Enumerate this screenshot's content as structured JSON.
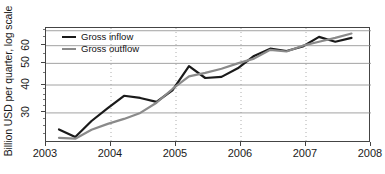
{
  "chart_data": {
    "type": "line",
    "title": "",
    "xlabel": "",
    "ylabel": "Billion USD per quarter, log scale",
    "yscale": "log",
    "ylim": [
      22,
      72
    ],
    "xlim": [
      2003.0,
      2008.0
    ],
    "grid": "horizontal-solid-and-vertical-dotted",
    "legend_position": "top-left-inside",
    "yticks": [
      30,
      40,
      50,
      60
    ],
    "ytick_labels": [
      "30",
      "40",
      "50",
      "60"
    ],
    "xticks": [
      2003,
      2004,
      2005,
      2006,
      2007,
      2008
    ],
    "xtick_labels": [
      "2003",
      "2004",
      "2005",
      "2006",
      "2007",
      "2008"
    ],
    "x": [
      2003.2,
      2003.45,
      2003.7,
      2003.95,
      2004.2,
      2004.45,
      2004.7,
      2004.95,
      2005.2,
      2005.45,
      2005.7,
      2005.95,
      2006.2,
      2006.45,
      2006.7,
      2006.95,
      2007.2,
      2007.45,
      2007.7
    ],
    "series": [
      {
        "name": "Gross inflow",
        "color": "#1a1a1a",
        "width": 2.2,
        "values": [
          25.3,
          23.4,
          27.6,
          31.5,
          35.8,
          35.0,
          33.6,
          38.0,
          48.6,
          43.0,
          43.5,
          47.5,
          54.0,
          58.2,
          56.8,
          59.5,
          65.7,
          62.5,
          65.0
        ]
      },
      {
        "name": "Gross outflow",
        "color": "#8a8a8a",
        "width": 2.2,
        "values": [
          23.2,
          23.0,
          25.2,
          26.8,
          28.2,
          30.0,
          33.3,
          38.5,
          43.7,
          45.3,
          47.3,
          50.0,
          52.5,
          57.5,
          56.5,
          60.0,
          62.5,
          65.0,
          68.0
        ]
      }
    ]
  },
  "legend": {
    "items": [
      {
        "label": "Gross inflow",
        "color": "#1a1a1a"
      },
      {
        "label": "Gross outflow",
        "color": "#8a8a8a"
      }
    ]
  },
  "axes": {
    "y_title": "Billion USD per quarter, log scale",
    "y_tick_labels": [
      "60",
      "50",
      "40",
      "30"
    ],
    "x_tick_labels": [
      "2003",
      "2004",
      "2005",
      "2006",
      "2007",
      "2008"
    ]
  }
}
